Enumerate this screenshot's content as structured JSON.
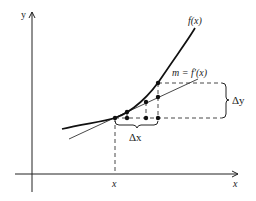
{
  "figure": {
    "colors": {
      "ink": "#222222",
      "background": "#ffffff"
    },
    "axes": {
      "x_label": "x",
      "y_label": "y",
      "x_tick_label": "x"
    },
    "labels": {
      "curve": "f(x)",
      "tangent": "m = f′(x)",
      "delta_x": "Δx",
      "delta_y": "Δy"
    }
  }
}
